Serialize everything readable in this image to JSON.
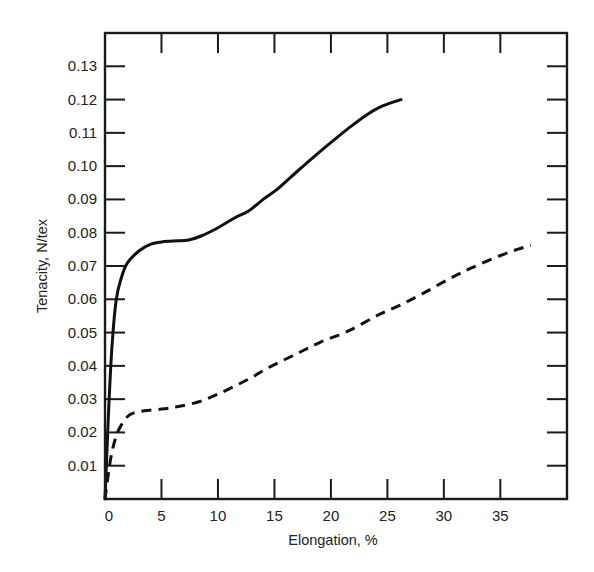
{
  "chart_data": {
    "type": "line",
    "title": "",
    "xlabel": "Elongation, %",
    "ylabel": "Tenacity, N/tex",
    "xlim": [
      0,
      40.9
    ],
    "ylim": [
      0,
      0.14
    ],
    "grid": false,
    "legend": null,
    "x_ticks": [
      0,
      5,
      10,
      15,
      20,
      25,
      30,
      35
    ],
    "x_tick_labels": [
      "0",
      "5",
      "10",
      "15",
      "20",
      "25",
      "30",
      "35"
    ],
    "y_ticks": [
      0.01,
      0.02,
      0.03,
      0.04,
      0.05,
      0.06,
      0.07,
      0.08,
      0.09,
      0.1,
      0.11,
      0.12,
      0.13
    ],
    "y_tick_labels": [
      "0.01",
      "0.02",
      "0.03",
      "0.04",
      "0.05",
      "0.06",
      "0.07",
      "0.08",
      "0.09",
      "0.10",
      "0.11",
      "0.12",
      "0.13"
    ],
    "series": [
      {
        "name": "solid",
        "style": "solid",
        "x": [
          0,
          0.3,
          0.6,
          1.0,
          1.5,
          2.0,
          3.0,
          4.0,
          5.0,
          6.0,
          7.4,
          8.5,
          10.0,
          11.5,
          12.7,
          14.0,
          15.4,
          17.2,
          18.9,
          20.5,
          21.6,
          23.0,
          24.2,
          25.3,
          26.2
        ],
        "y": [
          0,
          0.025,
          0.045,
          0.06,
          0.067,
          0.071,
          0.0745,
          0.0765,
          0.0772,
          0.0775,
          0.0778,
          0.079,
          0.0815,
          0.0845,
          0.0865,
          0.09,
          0.0935,
          0.099,
          0.104,
          0.1085,
          0.1115,
          0.115,
          0.1175,
          0.119,
          0.12
        ]
      },
      {
        "name": "dashed",
        "style": "dashed",
        "x": [
          0,
          0.5,
          1.0,
          1.5,
          2.0,
          2.5,
          3.5,
          5.0,
          6.5,
          8.3,
          10.0,
          12.7,
          14.5,
          16.3,
          17.2,
          19.0,
          21.6,
          24.3,
          26.0,
          28.0,
          30.4,
          32.5,
          34.9,
          36.5,
          37.7
        ],
        "y": [
          0,
          0.012,
          0.019,
          0.0225,
          0.0248,
          0.0258,
          0.0265,
          0.027,
          0.0278,
          0.0292,
          0.0315,
          0.036,
          0.0395,
          0.0425,
          0.044,
          0.047,
          0.0506,
          0.0555,
          0.058,
          0.0615,
          0.066,
          0.0695,
          0.073,
          0.075,
          0.0762
        ]
      }
    ]
  }
}
